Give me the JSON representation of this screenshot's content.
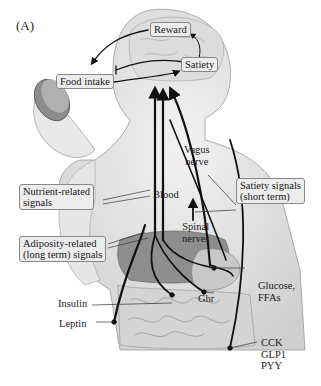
{
  "figure": {
    "panel_label": "(A)",
    "boxes": {
      "reward": "Reward",
      "satiety": "Satiety",
      "food_intake": "Food intake",
      "nutrient_related_1": "Nutrient-related",
      "nutrient_related_2": "signals",
      "adiposity_related_1": "Adiposity-related",
      "adiposity_related_2": "(long term) signals",
      "satiety_signals_1": "Satiety signals",
      "satiety_signals_2": "(short term)"
    },
    "labels": {
      "vagus_1": "Vagus",
      "vagus_2": "nerve",
      "blood": "Blood",
      "spinal_1": "Spinal",
      "spinal_2": "nerves",
      "glucose_1": "Glucose,",
      "glucose_2": "FFAs",
      "insulin": "Insulin",
      "leptin": "Leptin",
      "ghr": "Ghr",
      "cck": "CCK",
      "glp1": "GLP1",
      "pyy": "PYY"
    }
  }
}
